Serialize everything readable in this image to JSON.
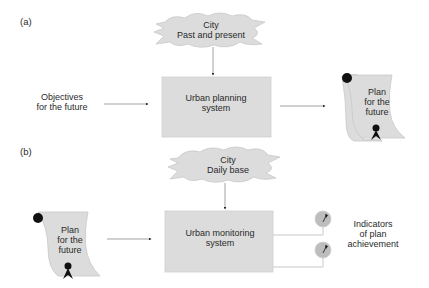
{
  "diagram": {
    "panel_a": {
      "label": "(a)",
      "cloud": {
        "line1": "City",
        "line2": "Past and present"
      },
      "input": {
        "line1": "Objectives",
        "line2": "for the future"
      },
      "box": {
        "line1": "Urban planning",
        "line2": "system"
      },
      "output_scroll": {
        "line1": "Plan",
        "line2": "for the",
        "line3": "future"
      }
    },
    "panel_b": {
      "label": "(b)",
      "cloud": {
        "line1": "City",
        "line2": "Daily base"
      },
      "input_scroll": {
        "line1": "Plan",
        "line2": "for the",
        "line3": "future"
      },
      "box": {
        "line1": "Urban monitoring",
        "line2": "system"
      },
      "indicators": {
        "line1": "Indicators",
        "line2": "of plan",
        "line3": "achievement"
      }
    },
    "colors": {
      "shape_fill": "#dcdcdc",
      "shape_stroke": "#c4c4c4",
      "arrow": "#555555",
      "seal": "#111111",
      "indicator_fill": "#bdbdbd"
    }
  }
}
